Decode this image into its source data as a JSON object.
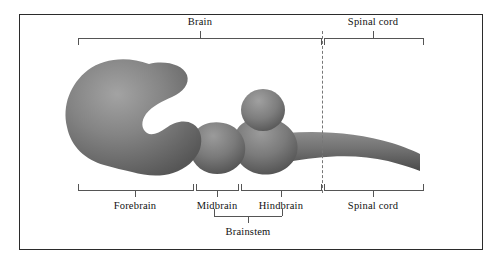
{
  "figure": {
    "frame_color": "#2b2b2b",
    "background": "#ffffff",
    "bracket_color": "#555555",
    "dashed_divider_color": "#777777"
  },
  "organism_colors": {
    "light": "#9a9a9a",
    "mid": "#7b7b7b",
    "dark": "#5a5a5a",
    "shadow": "#3f3f3f"
  },
  "top_brackets": [
    {
      "id": "brain",
      "label": "Brain",
      "x_start": 78,
      "x_end": 321,
      "tick_x": 200,
      "label_x": 200,
      "label_y": 16
    },
    {
      "id": "spinal-cord",
      "label": "Spinal cord",
      "x_start": 324,
      "x_end": 423,
      "tick_x": 373,
      "label_x": 373,
      "label_y": 16
    }
  ],
  "bottom_brackets": [
    {
      "id": "forebrain",
      "label": "Forebrain",
      "x_start": 78,
      "x_end": 193,
      "tick_x": 135,
      "label_x": 135
    },
    {
      "id": "midbrain",
      "label": "Midbrain",
      "x_start": 196,
      "x_end": 238,
      "tick_x": 217,
      "label_x": 217
    },
    {
      "id": "hindbrain",
      "label": "Hindbrain",
      "x_start": 241,
      "x_end": 321,
      "tick_x": 281,
      "label_x": 281
    },
    {
      "id": "spinal-cord",
      "label": "Spinal cord",
      "x_start": 324,
      "x_end": 423,
      "tick_x": 373,
      "label_x": 373
    }
  ],
  "brainstem_bracket": {
    "label": "Brainstem",
    "x_start": 214,
    "x_end": 282,
    "tick_x": 248,
    "label_x": 248,
    "label_y": 231
  },
  "anatomy_parts": [
    {
      "name": "forebrain-vesicle",
      "description": "large C-shaped vesicle opening to the right"
    },
    {
      "name": "midbrain-segment",
      "description": "rounded middle bulge"
    },
    {
      "name": "hindbrain-segment",
      "description": "rounded bulge with dorsal cerebellar bulb"
    },
    {
      "name": "cerebellar-bulb",
      "description": "small round dorsal bulb"
    },
    {
      "name": "spinal-cord-tail",
      "description": "tapering caudal extension to the right"
    }
  ]
}
